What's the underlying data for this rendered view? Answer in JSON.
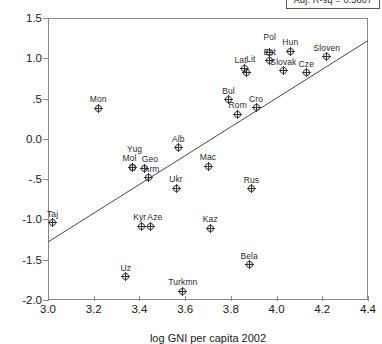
{
  "header": {
    "stat_label": "Adj. R-sq = 0.5807"
  },
  "axes": {
    "ylabel": "VA scores",
    "xlabel": "log GNI per capita 2002",
    "yticks": [
      "1.5",
      "1.0",
      ".5",
      "0.0",
      "-.5",
      "-1.0",
      "-1.5",
      "-2.0"
    ],
    "ytick_values": [
      1.5,
      1.0,
      0.5,
      0.0,
      -0.5,
      -1.0,
      -1.5,
      -2.0
    ],
    "xticks": [
      "3.0",
      "3.2",
      "3.4",
      "3.6",
      "3.8",
      "4.0",
      "4.2",
      "4.4"
    ],
    "xtick_values": [
      3.0,
      3.2,
      3.4,
      3.6,
      3.8,
      4.0,
      4.2,
      4.4
    ]
  },
  "chart_data": {
    "type": "scatter",
    "title": "",
    "xlabel": "log GNI per capita 2002",
    "ylabel": "VA scores",
    "xlim": [
      3.0,
      4.4
    ],
    "ylim": [
      -2.0,
      1.5
    ],
    "grid": false,
    "legend": null,
    "annotations": [
      "Adj. R-sq = 0.5807"
    ],
    "fit_line": {
      "type": "linear",
      "x": [
        3.0,
        4.4
      ],
      "y": [
        -1.28,
        1.22
      ]
    },
    "points": [
      {
        "label": "Taj",
        "x": 3.02,
        "y": -0.98,
        "label_dx": 0,
        "label_dy": -9
      },
      {
        "label": "Mon",
        "x": 3.22,
        "y": 0.44,
        "label_dx": 0,
        "label_dy": -9
      },
      {
        "label": "Uz",
        "x": 3.34,
        "y": -1.65,
        "label_dx": 0,
        "label_dy": -9
      },
      {
        "label": "Yug",
        "x": 3.37,
        "y": -0.29,
        "label_dx": 2,
        "label_dy": -18
      },
      {
        "label": "Mol",
        "x": 3.37,
        "y": -0.29,
        "label_dx": -3,
        "label_dy": -9
      },
      {
        "label": "Geo",
        "x": 3.42,
        "y": -0.3,
        "label_dx": 6,
        "label_dy": -9
      },
      {
        "label": "Kyr",
        "x": 3.41,
        "y": -1.02,
        "label_dx": -2,
        "label_dy": -9
      },
      {
        "label": "Aze",
        "x": 3.45,
        "y": -1.02,
        "label_dx": 4,
        "label_dy": -9
      },
      {
        "label": "Arm",
        "x": 3.44,
        "y": -0.42,
        "label_dx": 3,
        "label_dy": -9
      },
      {
        "label": "Ukr",
        "x": 3.56,
        "y": -0.55,
        "label_dx": 0,
        "label_dy": -9
      },
      {
        "label": "Alb",
        "x": 3.57,
        "y": -0.05,
        "label_dx": 0,
        "label_dy": -9
      },
      {
        "label": "Turkmn",
        "x": 3.59,
        "y": -1.83,
        "label_dx": 0,
        "label_dy": -9
      },
      {
        "label": "Mac",
        "x": 3.7,
        "y": -0.28,
        "label_dx": 0,
        "label_dy": -9
      },
      {
        "label": "Kaz",
        "x": 3.71,
        "y": -1.05,
        "label_dx": 0,
        "label_dy": -9
      },
      {
        "label": "Bul",
        "x": 3.79,
        "y": 0.55,
        "label_dx": 0,
        "label_dy": -9
      },
      {
        "label": "Rom",
        "x": 3.83,
        "y": 0.37,
        "label_dx": 0,
        "label_dy": -9
      },
      {
        "label": "Lat",
        "x": 3.86,
        "y": 0.93,
        "label_dx": -4,
        "label_dy": -9
      },
      {
        "label": "Lit",
        "x": 3.87,
        "y": 0.89,
        "label_dx": 4,
        "label_dy": -13
      },
      {
        "label": "Bela",
        "x": 3.88,
        "y": -1.5,
        "label_dx": 0,
        "label_dy": -9
      },
      {
        "label": "Rus",
        "x": 3.89,
        "y": -0.56,
        "label_dx": 0,
        "label_dy": -9
      },
      {
        "label": "Cro",
        "x": 3.91,
        "y": 0.45,
        "label_dx": 0,
        "label_dy": -9
      },
      {
        "label": "Pol",
        "x": 3.97,
        "y": 1.13,
        "label_dx": 0,
        "label_dy": -16
      },
      {
        "label": "Est",
        "x": 3.97,
        "y": 1.03,
        "label_dx": 0,
        "label_dy": -9
      },
      {
        "label": "Slovak",
        "x": 4.03,
        "y": 0.91,
        "label_dx": 0,
        "label_dy": -9
      },
      {
        "label": "Hun",
        "x": 4.06,
        "y": 1.15,
        "label_dx": 0,
        "label_dy": -9
      },
      {
        "label": "Cze",
        "x": 4.13,
        "y": 0.88,
        "label_dx": 0,
        "label_dy": -9
      },
      {
        "label": "Sloven",
        "x": 4.22,
        "y": 1.08,
        "label_dx": 0,
        "label_dy": -9
      }
    ]
  }
}
